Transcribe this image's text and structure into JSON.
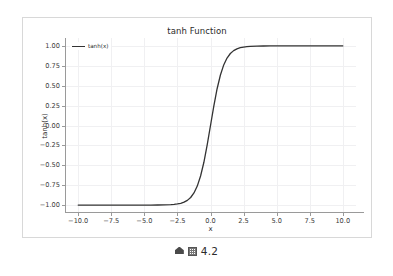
{
  "figure": {
    "title": "tanh Function",
    "xlabel": "x",
    "ylabel": "tanh(x)",
    "legend_label": "tanh(x)",
    "line_color": "#333333",
    "grid_color": "#f0f0f2",
    "spine_color": "#9a9a9a",
    "frame_color": "#d8d8d8",
    "background": "#ffffff"
  },
  "caption": {
    "marker_icon": "diamond-marker-icon",
    "box_glyph": "tofu-box-icon",
    "number": "4.2"
  },
  "chart_data": {
    "type": "line",
    "title": "tanh Function",
    "xlabel": "x",
    "ylabel": "tanh(x)",
    "xlim": [
      -11.0,
      11.0
    ],
    "ylim": [
      -1.1,
      1.1
    ],
    "grid": true,
    "legend_position": "upper left",
    "xticks": [
      -10.0,
      -7.5,
      -5.0,
      -2.5,
      0.0,
      2.5,
      5.0,
      7.5,
      10.0
    ],
    "xticklabels": [
      "-10.0",
      "-7.5",
      "-5.0",
      "-2.5",
      "0.0",
      "2.5",
      "5.0",
      "7.5",
      "10.0"
    ],
    "yticks": [
      1.0,
      0.75,
      0.5,
      0.25,
      0.0,
      -0.25,
      -0.5,
      -0.75,
      -1.0
    ],
    "yticklabels": [
      "1.00",
      "0.75",
      "0.50",
      "0.25",
      "0.00",
      "-0.25",
      "-0.50",
      "-0.75",
      "-1.00"
    ],
    "series": [
      {
        "name": "tanh(x)",
        "color": "#333333",
        "x": [
          -10.0,
          -9.5,
          -9.0,
          -8.5,
          -8.0,
          -7.5,
          -7.0,
          -6.5,
          -6.0,
          -5.5,
          -5.0,
          -4.5,
          -4.0,
          -3.5,
          -3.0,
          -2.75,
          -2.5,
          -2.25,
          -2.0,
          -1.75,
          -1.5,
          -1.25,
          -1.0,
          -0.75,
          -0.5,
          -0.25,
          0.0,
          0.25,
          0.5,
          0.75,
          1.0,
          1.25,
          1.5,
          1.75,
          2.0,
          2.25,
          2.5,
          2.75,
          3.0,
          3.5,
          4.0,
          4.5,
          5.0,
          5.5,
          6.0,
          6.5,
          7.0,
          7.5,
          8.0,
          8.5,
          9.0,
          9.5,
          10.0
        ],
        "y": [
          -1.0,
          -1.0,
          -1.0,
          -1.0,
          -1.0,
          -1.0,
          -1.0,
          -1.0,
          -0.99999,
          -0.99997,
          -0.9999,
          -0.99975,
          -0.99933,
          -0.99818,
          -0.99505,
          -0.99186,
          -0.98661,
          -0.97803,
          -0.96403,
          -0.94138,
          -0.90515,
          -0.84828,
          -0.76159,
          -0.63515,
          -0.46212,
          -0.24492,
          0.0,
          0.24492,
          0.46212,
          0.63515,
          0.76159,
          0.84828,
          0.90515,
          0.94138,
          0.96403,
          0.97803,
          0.98661,
          0.99186,
          0.99505,
          0.99818,
          0.99933,
          0.99975,
          0.9999,
          0.99997,
          0.99999,
          1.0,
          1.0,
          1.0,
          1.0,
          1.0,
          1.0,
          1.0,
          1.0
        ]
      }
    ]
  }
}
